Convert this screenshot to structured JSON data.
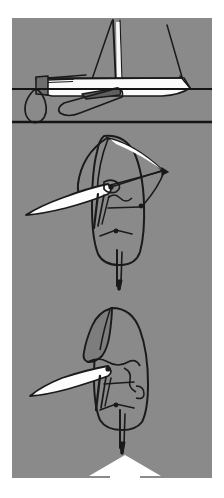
{
  "figure": {
    "alt_text": "Three hand-drawn views of a sailing dinghy: a side profile at the waterline, and two stern views showing a crew member hiking out, with an upward arrow indicating the wind force direction.",
    "panel_count": 3
  },
  "colors": {
    "page_background": "#ffffff",
    "panel_background": "#8a8a8a",
    "ink": "#1a1a1a",
    "sail_highlight": "#fdfdfd",
    "hull_fill": "#fafafa",
    "arrow_fill": "#ffffff",
    "waterline": "#141414",
    "divider": "#141414",
    "shadow_gray": "#6e6e6e"
  },
  "layout": {
    "panel": {
      "x": 12,
      "y": 18,
      "width": 200,
      "height": 460
    },
    "waterline_y": 71,
    "divider_y": 104,
    "arrow": {
      "tip_x": 113,
      "tip_y": 437,
      "half_width": 36,
      "shaft_half_width": 15,
      "base_y": 460
    }
  },
  "panels": [
    {
      "id": "panel-side-view",
      "name": "side-profile-view",
      "label": "Side view at waterline",
      "elements": [
        "mast",
        "forestay",
        "shroud",
        "mainsail-luff",
        "hull-profile",
        "transom",
        "bow",
        "centreboard",
        "rudder-blade",
        "tiller",
        "waterline"
      ]
    },
    {
      "id": "panel-stern-heeled",
      "name": "stern-view-heeled",
      "label": "Stern view, crew hiking, boat heeled",
      "elements": [
        "hull-stern-outline",
        "mainsail-curved",
        "boom",
        "mainsheet",
        "crew-hiking-out",
        "hiking-straps",
        "tiller-extension",
        "centreboard-down"
      ]
    },
    {
      "id": "panel-stern-upright",
      "name": "stern-view-upright",
      "label": "Stern view, crew hiking, boat upright, wind force arrow",
      "elements": [
        "hull-stern-outline",
        "mainsail-furled",
        "crew-hiking-out",
        "tiller-extension",
        "centreboard-down",
        "force-arrow-up"
      ]
    }
  ],
  "annotations": {
    "arrow_meaning": "force-direction-arrow",
    "waterline_meaning": "water-surface-line",
    "divider_meaning": "panel-separator-line"
  }
}
